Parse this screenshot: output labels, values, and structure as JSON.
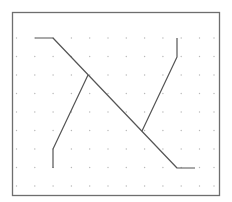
{
  "diagram": {
    "type": "line-routing-grid",
    "background": "#ffffff",
    "frame": {
      "x": 12.5,
      "y": 12.5,
      "width": 207,
      "height": 183,
      "stroke": "#6e6e6e",
      "stroke_width": 1.3
    },
    "grid": {
      "dot_color": "#b8b8b8",
      "dot_radius": 0.7,
      "xs": [
        16.5,
        34.8,
        53.1,
        71.4,
        89.7,
        108,
        126.3,
        144.6,
        162.9,
        181.2,
        199.5,
        214
      ],
      "ys": [
        38,
        56.5,
        75,
        93.5,
        112,
        130.5,
        149,
        167.5,
        186
      ]
    },
    "line_color": "#555555",
    "line_width": 1.2,
    "paths": [
      {
        "name": "main-diagonal-path",
        "points": [
          [
            35,
            38
          ],
          [
            53,
            38
          ],
          [
            177,
            168
          ],
          [
            195,
            168
          ]
        ]
      },
      {
        "name": "left-branch-path",
        "points": [
          [
            88,
            75
          ],
          [
            53,
            149
          ],
          [
            53,
            168
          ]
        ]
      },
      {
        "name": "right-branch-path",
        "points": [
          [
            142,
            131
          ],
          [
            177,
            57
          ],
          [
            177,
            38
          ]
        ]
      }
    ]
  }
}
